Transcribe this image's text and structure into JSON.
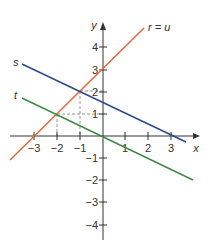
{
  "diagram": {
    "type": "coordinate-graph",
    "axes": {
      "x_label": "x",
      "y_label": "y",
      "x_ticks": [
        {
          "value": -3,
          "label": "−3"
        },
        {
          "value": -2,
          "label": "−2"
        },
        {
          "value": -1,
          "label": "−1"
        },
        {
          "value": 1,
          "label": "1"
        },
        {
          "value": 2,
          "label": "2"
        },
        {
          "value": 3,
          "label": "3"
        }
      ],
      "y_ticks": [
        {
          "value": 4,
          "label": "4"
        },
        {
          "value": 3,
          "label": "3"
        },
        {
          "value": 2,
          "label": "2"
        },
        {
          "value": 1,
          "label": "1"
        },
        {
          "value": -1,
          "label": "−1"
        },
        {
          "value": -2,
          "label": "−2"
        },
        {
          "value": -3,
          "label": "−3"
        },
        {
          "value": -4,
          "label": "−4"
        }
      ]
    },
    "lines": [
      {
        "name": "r = u",
        "label": "r = u",
        "equation": "y = x + 3",
        "color": "#E8643A"
      },
      {
        "name": "s",
        "label": "s",
        "equation": "y = -0.5x + 1.5",
        "color": "#2B4A8C"
      },
      {
        "name": "t",
        "label": "t",
        "equation": "y = -0.5x",
        "color": "#3E8A4A"
      }
    ],
    "guide_points": [
      {
        "x": -1,
        "y": 2,
        "description": "intersection of r=u and s"
      },
      {
        "x": -2,
        "y": 1,
        "description": "intersection of r=u and t"
      }
    ],
    "colors": {
      "axis": "#333333",
      "dashed_guide": "#888888"
    }
  }
}
